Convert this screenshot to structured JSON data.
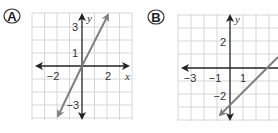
{
  "choices": [
    {
      "label": "A",
      "graph": {
        "x_axis_label": "x",
        "y_axis_label": "y",
        "x_ticks": [
          "−2",
          "2"
        ],
        "y_ticks": [
          "3",
          "1",
          "−3"
        ],
        "line": {
          "slope": 2,
          "y_intercept": 0,
          "equation": "y = 2x"
        }
      }
    },
    {
      "label": "B",
      "graph": {
        "x_axis_label": "x",
        "y_axis_label": "y",
        "x_ticks": [
          "−3",
          "−1",
          "1"
        ],
        "y_ticks": [
          "2",
          "−2"
        ],
        "line": {
          "slope": 1,
          "y_intercept": -3,
          "equation": "y = x − 3"
        }
      }
    }
  ],
  "colors": {
    "grid": "#d6d6d6",
    "axis": "#222222",
    "line": "#808080"
  }
}
